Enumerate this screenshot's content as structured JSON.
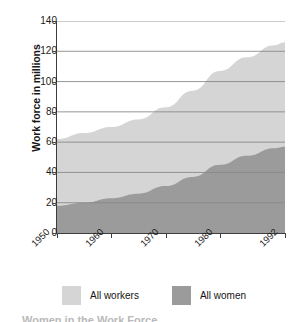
{
  "chart_data": {
    "type": "area",
    "title": "",
    "subtitle": "",
    "xlabel": "",
    "ylabel": "Work force in millions",
    "xlim": [
      1950,
      1992
    ],
    "ylim": [
      0,
      140
    ],
    "grid": true,
    "legend_position": "bottom-left",
    "x_tick_labels": [
      "1950",
      "1960",
      "1970",
      "1980",
      "1992"
    ],
    "x_tick_values": [
      1950,
      1960,
      1970,
      1980,
      1992
    ],
    "y_tick_labels": [
      "140",
      "120",
      "100",
      "80",
      "60",
      "40",
      "20",
      "0"
    ],
    "y_tick_values": [
      140,
      120,
      100,
      80,
      60,
      40,
      20,
      0
    ],
    "x": [
      1950,
      1955,
      1960,
      1965,
      1970,
      1975,
      1980,
      1985,
      1990,
      1992
    ],
    "series": [
      {
        "name": "All workers",
        "color": "#d5d5d5",
        "values": [
          62,
          66,
          70,
          75,
          83,
          94,
          107,
          116,
          124,
          126
        ]
      },
      {
        "name": "All women",
        "color": "#9b9b9b",
        "values": [
          18,
          20,
          23,
          26,
          31,
          37,
          45,
          51,
          56,
          57
        ]
      }
    ],
    "colors": {
      "all_workers": "#d5d5d5",
      "all_women": "#9b9b9b",
      "gridline": "#8a8a8a",
      "axis": "#3d3d3d",
      "text": "#1c1c1c",
      "background": "#ffffff"
    }
  },
  "legend": {
    "items": [
      {
        "label": "All workers",
        "color": "#d5d5d5"
      },
      {
        "label": "All women",
        "color": "#9b9b9b"
      }
    ]
  },
  "caption": {
    "cut_text": "Women in the Work Force"
  }
}
